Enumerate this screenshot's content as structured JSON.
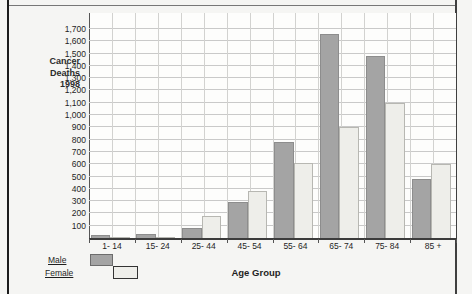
{
  "side_label": {
    "lines": [
      "Cancer",
      "Deaths",
      "1998"
    ]
  },
  "chart_data": {
    "type": "bar",
    "title": "Deaths due to cancer in Victoria by age group",
    "categories": [
      "1- 14",
      "15- 24",
      "25- 44",
      "45- 54",
      "55- 64",
      "65- 74",
      "75- 84",
      "85 +"
    ],
    "series": [
      {
        "name": "Male",
        "color": "#a4a4a4",
        "border": "#8d8d8d",
        "values": [
          25,
          30,
          85,
          290,
          780,
          1660,
          1480,
          480
        ]
      },
      {
        "name": "Female",
        "color": "#eeeeea",
        "border": "#b7b7b2",
        "values": [
          8,
          12,
          180,
          380,
          610,
          900,
          1100,
          600
        ]
      }
    ],
    "xlabel": "Age Group",
    "ylabel": "Cancer Deaths 1998",
    "ylim": [
      0,
      1800
    ],
    "ytick_step": 100,
    "ytick_min": 100,
    "ytick_max": 1700,
    "grid": "both",
    "legend_position": "bottom-left",
    "gridline_color": "#c9c9c9",
    "axis_color": "#3c3c3c"
  }
}
